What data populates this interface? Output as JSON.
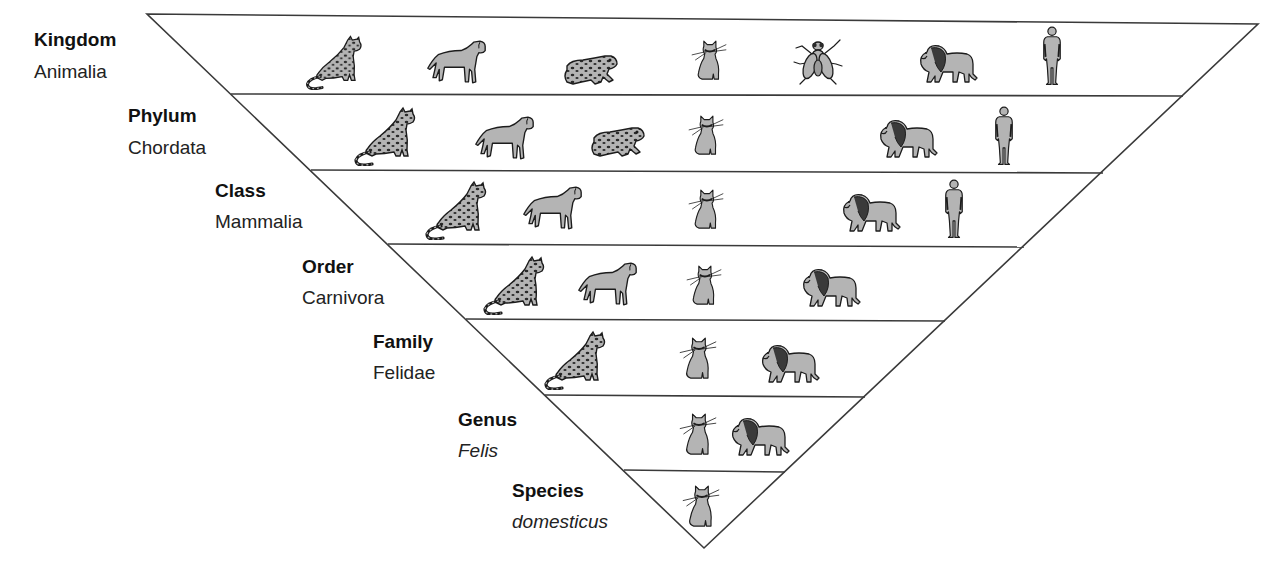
{
  "diagram": {
    "type": "taxonomy-inverted-pyramid",
    "colors": {
      "line": "#3a3a3a",
      "animal_fill": "#b4b4b4",
      "animal_stroke": "#1c1c1c",
      "spot": "#2a2a2a",
      "background": "#ffffff"
    },
    "levels": [
      {
        "rank": "Kingdom",
        "taxon": "Animalia",
        "italic": false,
        "animals": [
          "leopard",
          "dog",
          "frog",
          "cat",
          "fly",
          "lion",
          "human"
        ]
      },
      {
        "rank": "Phylum",
        "taxon": "Chordata",
        "italic": false,
        "animals": [
          "leopard",
          "dog",
          "frog",
          "cat",
          "lion",
          "human"
        ]
      },
      {
        "rank": "Class",
        "taxon": "Mammalia",
        "italic": false,
        "animals": [
          "leopard",
          "dog",
          "cat",
          "lion",
          "human"
        ]
      },
      {
        "rank": "Order",
        "taxon": "Carnivora",
        "italic": false,
        "animals": [
          "leopard",
          "dog",
          "cat",
          "lion"
        ]
      },
      {
        "rank": "Family",
        "taxon": "Felidae",
        "italic": false,
        "animals": [
          "leopard",
          "cat",
          "lion"
        ]
      },
      {
        "rank": "Genus",
        "taxon": "Felis",
        "italic": true,
        "animals": [
          "cat",
          "lion"
        ]
      },
      {
        "rank": "Species",
        "taxon": "domesticus",
        "italic": true,
        "animals": [
          "cat"
        ]
      }
    ]
  }
}
